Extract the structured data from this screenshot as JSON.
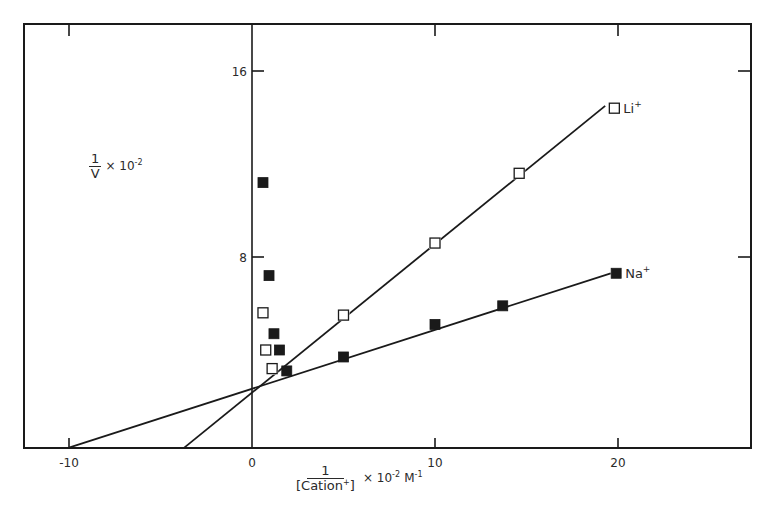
{
  "chart_data": {
    "type": "scatter",
    "title": "",
    "xlabel": {
      "numerator": "1",
      "denominator": "[Cation",
      "denominator_sup": "+",
      "denominator_close": "]",
      "suffix": "× 10",
      "suffix_exp": "-2",
      "unit": "M",
      "unit_exp": "-1"
    },
    "ylabel": {
      "numerator": "1",
      "denominator": "V",
      "suffix": "× 10",
      "suffix_exp": "-2"
    },
    "xlim": [
      -12.5,
      27.3
    ],
    "ylim": [
      -0.2,
      18.0
    ],
    "grid": false,
    "x_ticks": [
      {
        "value": -10,
        "label": "-10"
      },
      {
        "value": 0,
        "label": "0"
      },
      {
        "value": 10,
        "label": "10"
      },
      {
        "value": 20,
        "label": "20"
      }
    ],
    "y_ticks": [
      {
        "value": 8,
        "label": "8"
      },
      {
        "value": 16,
        "label": "16"
      }
    ],
    "series": [
      {
        "name": "Li+",
        "label": "Li",
        "label_sup": "+",
        "marker": "open-square",
        "points_on_line": [
          {
            "x": 1.1,
            "y": 3.2
          },
          {
            "x": 5.0,
            "y": 5.5
          },
          {
            "x": 10.0,
            "y": 8.6
          },
          {
            "x": 14.6,
            "y": 11.6
          },
          {
            "x": 19.8,
            "y": 14.4
          }
        ],
        "points_off_line": [
          {
            "x": 0.6,
            "y": 5.6
          },
          {
            "x": 0.75,
            "y": 4.0
          }
        ],
        "fit_line": {
          "x1": -3.7,
          "y1": -0.2,
          "x2": 19.3,
          "y2": 14.5
        }
      },
      {
        "name": "Na+",
        "label": "Na",
        "label_sup": "+",
        "marker": "filled-square",
        "points_on_line": [
          {
            "x": 1.9,
            "y": 3.1
          },
          {
            "x": 5.0,
            "y": 3.7
          },
          {
            "x": 10.0,
            "y": 5.1
          },
          {
            "x": 13.7,
            "y": 5.9
          },
          {
            "x": 19.9,
            "y": 7.3
          }
        ],
        "points_off_line": [
          {
            "x": 0.6,
            "y": 11.2
          },
          {
            "x": 0.93,
            "y": 7.2
          },
          {
            "x": 1.2,
            "y": 4.7
          },
          {
            "x": 1.5,
            "y": 4.0
          }
        ],
        "fit_line": {
          "x1": -10.0,
          "y1": -0.2,
          "x2": 19.6,
          "y2": 7.3
        }
      }
    ],
    "annotations": [
      {
        "text": "Li+",
        "near": "last Li+ point"
      },
      {
        "text": "Na+",
        "near": "last Na+ point"
      }
    ],
    "legend_position": "inline labels at line ends",
    "colors": {
      "ink": "#1a1a1a",
      "background": "#ffffff"
    }
  }
}
